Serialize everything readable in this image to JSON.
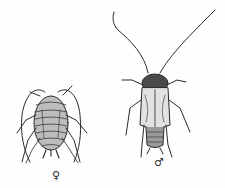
{
  "figure": {
    "female": {
      "symbol": "♀"
    },
    "male": {
      "symbol": "♂"
    },
    "colors": {
      "ink": "#2a2a2a",
      "background": "#fefefe"
    }
  }
}
